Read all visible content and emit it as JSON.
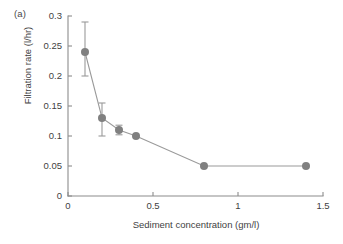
{
  "figure": {
    "panel_label": "(a)",
    "marker_color": "#808080",
    "line_color": "#9a9a9a",
    "axis_color": "#8c8c8c",
    "text_color": "#3f3f3f",
    "background": "#ffffff"
  },
  "chart_data": {
    "type": "scatter",
    "title": "",
    "subtitle": "",
    "xlabel": "Sediment concentration (gm/l)",
    "ylabel": "Filtration rate (l/hr)",
    "xlim": [
      0,
      1.5
    ],
    "ylim": [
      0,
      0.3
    ],
    "xticks": [
      0,
      0.5,
      1,
      1.5
    ],
    "xticklabels": [
      "0",
      "0.5",
      "1",
      "1.5"
    ],
    "yticks": [
      0,
      0.05,
      0.1,
      0.15,
      0.2,
      0.25,
      0.3
    ],
    "yticklabels": [
      "0",
      "0.05",
      "0.1",
      "0.15",
      "0.2",
      "0.25",
      "0.3"
    ],
    "grid": false,
    "legend": null,
    "annotations": [
      "(a)"
    ],
    "series": [
      {
        "name": "Filtration rate",
        "x": [
          0.1,
          0.2,
          0.3,
          0.4,
          0.8,
          1.4
        ],
        "y": [
          0.24,
          0.13,
          0.11,
          0.1,
          0.05,
          0.05
        ],
        "yerr_upper": [
          0.05,
          0.025,
          0.008,
          0.0,
          0.0,
          0.0
        ],
        "yerr_lower": [
          0.04,
          0.03,
          0.008,
          0.0,
          0.0,
          0.0
        ],
        "marker": "circle",
        "connected": true
      }
    ]
  }
}
